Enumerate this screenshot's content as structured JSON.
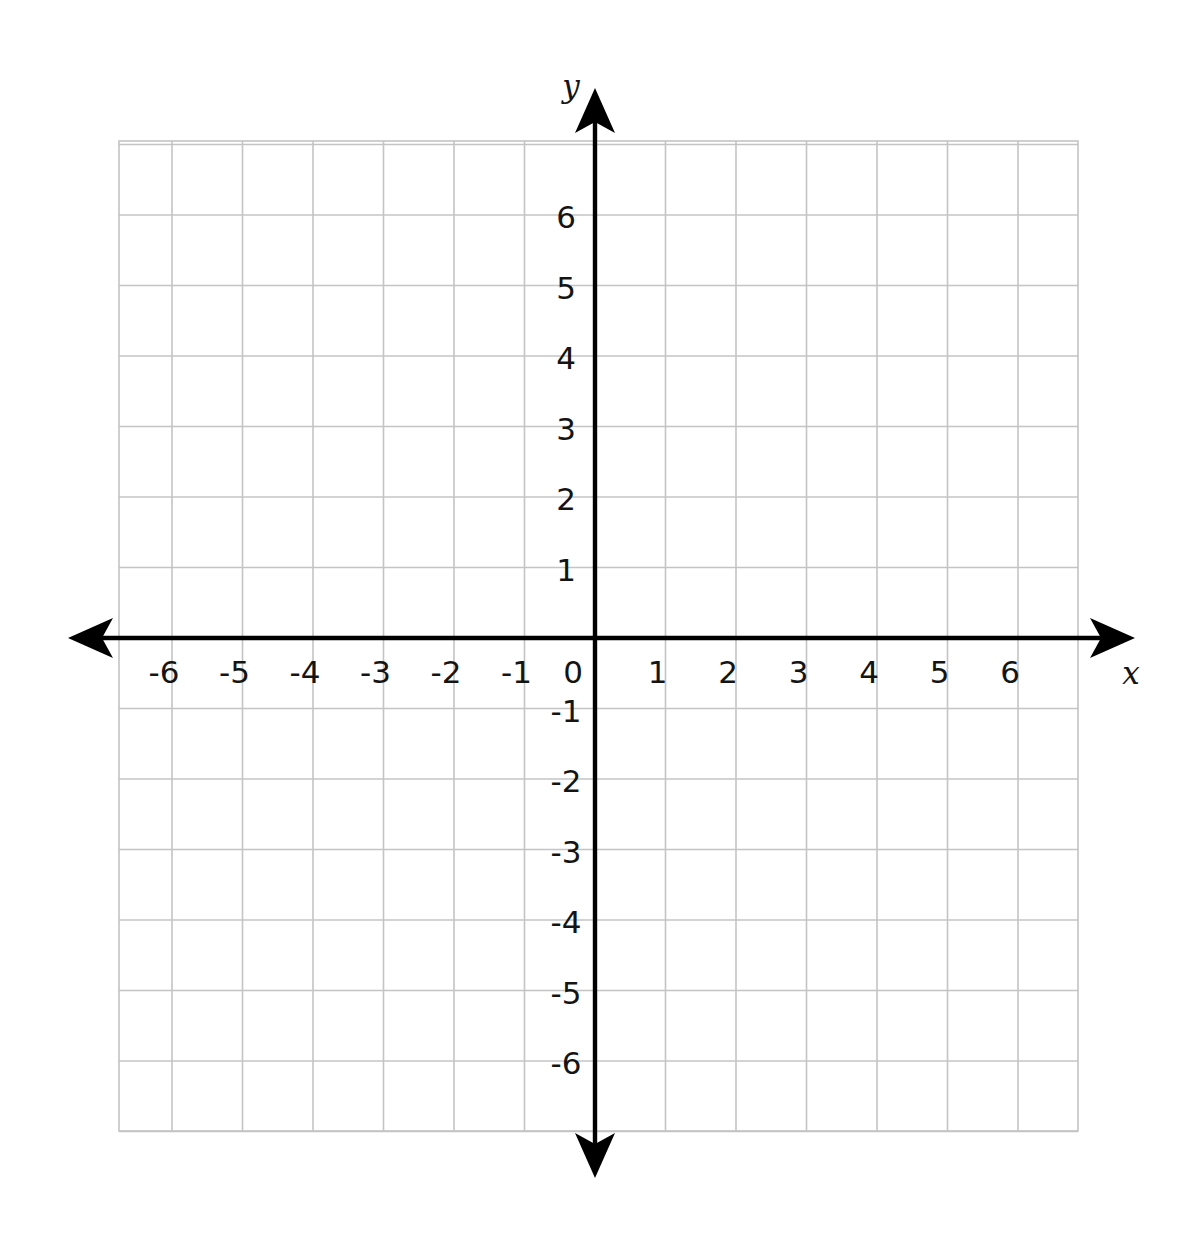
{
  "chart_data": {
    "type": "scatter",
    "title": "",
    "subtitle": "",
    "xlabel": "x",
    "ylabel": "y",
    "xlim": [
      -7,
      7
    ],
    "ylim": [
      -7,
      7
    ],
    "grid": true,
    "legend": null,
    "series": [],
    "x": [],
    "values": [],
    "annotations": [],
    "x_tick_labels": [
      "-6",
      "-5",
      "-4",
      "-3",
      "-2",
      "-1",
      "1",
      "2",
      "3",
      "4",
      "5",
      "6"
    ],
    "x_tick_values": [
      -6,
      -5,
      -4,
      -3,
      -2,
      -1,
      1,
      2,
      3,
      4,
      5,
      6
    ],
    "y_tick_labels": [
      "6",
      "5",
      "4",
      "3",
      "2",
      "1",
      "-1",
      "-2",
      "-3",
      "-4",
      "-5",
      "-6"
    ],
    "y_tick_values": [
      6,
      5,
      4,
      3,
      2,
      1,
      -1,
      -2,
      -3,
      -4,
      -5,
      -6
    ],
    "origin_label": "0",
    "tick_step": 1,
    "grid_step": 1,
    "axis_arrows": [
      "left",
      "right",
      "up",
      "down"
    ],
    "colors": {
      "grid": "#c4c4c4",
      "axis": "#000000",
      "text": "#141414",
      "background": "#ffffff"
    }
  },
  "geometry": {
    "grid_left_px": 119,
    "grid_right_px": 1078,
    "grid_top_px": 141,
    "grid_bottom_px": 1131,
    "origin_x_px": 595,
    "origin_y_px": 638,
    "cell_px": 70.5,
    "x_arrow_left_px": 68,
    "x_arrow_right_px": 1135,
    "y_arrow_top_px": 88,
    "y_arrow_bottom_px": 1178
  },
  "labels": {
    "y_axis_name": "y",
    "x_axis_name": "x"
  }
}
